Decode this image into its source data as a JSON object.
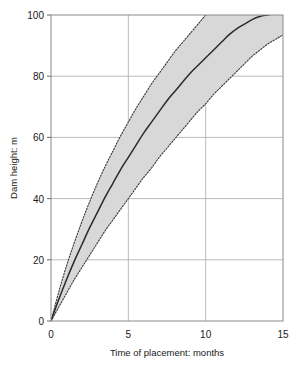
{
  "chart_data": {
    "type": "line",
    "title": "",
    "subtitle": "",
    "xlabel": "Time of placement: months",
    "ylabel": "Dam height: m",
    "xlim": [
      0,
      15
    ],
    "ylim": [
      0,
      100
    ],
    "xticks": [
      0,
      5,
      10,
      15
    ],
    "yticks": [
      0,
      20,
      40,
      60,
      80,
      100
    ],
    "xtick_labels": [
      "0",
      "5",
      "10",
      "15"
    ],
    "ytick_labels": [
      "0",
      "20",
      "40",
      "60",
      "80",
      "100"
    ],
    "grid": true,
    "grid_axes": "both",
    "legend": null,
    "legend_position": "none",
    "annotations": [],
    "series": [
      {
        "name": "Upper bound",
        "style": "dotted",
        "color": "#3a3a3a",
        "x": [
          0,
          0.5,
          1,
          1.5,
          2,
          2.5,
          3,
          3.5,
          4,
          4.5,
          5,
          5.5,
          6,
          6.5,
          7,
          7.5,
          8,
          8.5,
          9
        ],
        "values": [
          0,
          9.5,
          18,
          25.5,
          32.5,
          39,
          45,
          50.5,
          55.5,
          60.5,
          65,
          69.5,
          73.5,
          77.5,
          81,
          84.5,
          88,
          91,
          94
        ]
      },
      {
        "name": "Mean",
        "style": "solid",
        "color": "#2b2b2b",
        "x": [
          0,
          0.5,
          1,
          1.5,
          2,
          2.5,
          3,
          3.5,
          4,
          4.5,
          5,
          5.5,
          6,
          6.5,
          7,
          7.5,
          8,
          8.5,
          9,
          9.5,
          10,
          10.5,
          11,
          11.5,
          12,
          12.5,
          13,
          13.5,
          14
        ],
        "values": [
          0,
          7,
          13.5,
          19.5,
          25,
          30.5,
          35.5,
          40.5,
          45,
          49.5,
          53.5,
          57.5,
          61.5,
          65,
          68.5,
          72,
          75,
          78,
          81,
          83.5,
          86,
          88.5,
          91,
          93.5,
          95.5,
          97,
          98.5,
          99.5,
          100
        ]
      },
      {
        "name": "Lower bound",
        "style": "dotted",
        "color": "#3a3a3a",
        "x": [
          0,
          0.5,
          1,
          1.5,
          2,
          2.5,
          3,
          3.5,
          4,
          4.5,
          5,
          5.5,
          6,
          6.5,
          7,
          7.5,
          8,
          8.5,
          9,
          9.5,
          10,
          10.5,
          11,
          11.5,
          12,
          12.5,
          13,
          13.5,
          14,
          14.5,
          15
        ],
        "values": [
          0,
          4.5,
          9,
          13.5,
          17.5,
          21.5,
          25.5,
          29.5,
          33,
          36.5,
          40,
          43.5,
          47,
          50,
          53.5,
          56.5,
          59.5,
          62.5,
          65.5,
          68.5,
          71,
          74,
          76.5,
          79,
          81.5,
          84,
          86.5,
          88.5,
          90.5,
          92,
          93.5
        ]
      }
    ],
    "band": {
      "name": "Uncertainty band",
      "fill_color": "#d8d8d8",
      "between": [
        "Lower bound",
        "Upper bound"
      ]
    }
  }
}
